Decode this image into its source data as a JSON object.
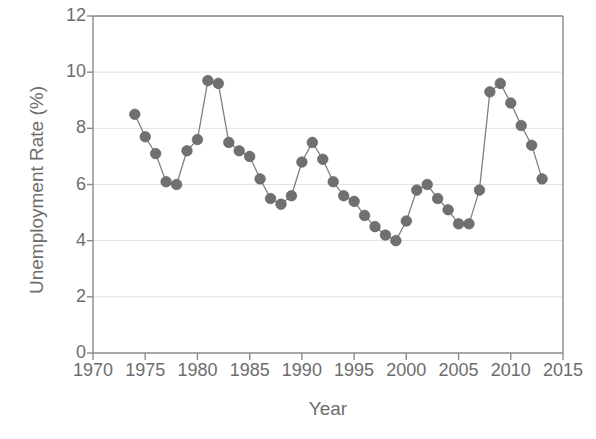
{
  "chart_data": {
    "type": "line",
    "title": "",
    "xlabel": "Year",
    "ylabel": "Unemployment Rate (%)",
    "xlim": [
      1970,
      2015
    ],
    "ylim": [
      0,
      12
    ],
    "xticks": [
      1970,
      1975,
      1980,
      1985,
      1990,
      1995,
      2000,
      2005,
      2010,
      2015
    ],
    "yticks": [
      0,
      2,
      4,
      6,
      8,
      10,
      12
    ],
    "grid": true,
    "legend": null,
    "marker": "circle",
    "marker_color": "#707070",
    "line_color": "#808080",
    "x": [
      1974,
      1975,
      1976,
      1977,
      1978,
      1979,
      1980,
      1981,
      1982,
      1983,
      1984,
      1985,
      1986,
      1987,
      1988,
      1989,
      1990,
      1991,
      1992,
      1993,
      1994,
      1995,
      1996,
      1997,
      1998,
      1999,
      2000,
      2001,
      2002,
      2003,
      2004,
      2005,
      2006,
      2007,
      2008,
      2009,
      2010,
      2011,
      2012,
      2013
    ],
    "values": [
      8.5,
      7.7,
      7.1,
      6.1,
      6.0,
      7.2,
      7.6,
      9.7,
      9.6,
      7.5,
      7.2,
      7.0,
      6.2,
      5.5,
      5.3,
      5.6,
      6.8,
      7.5,
      6.9,
      6.1,
      5.6,
      5.4,
      4.9,
      4.5,
      4.2,
      4.0,
      4.7,
      5.8,
      6.0,
      5.5,
      5.1,
      4.6,
      4.6,
      5.8,
      9.3,
      9.6,
      8.9,
      8.1,
      7.4,
      6.2
    ],
    "point_labels": null
  },
  "axes": {
    "y_tick_labels": [
      "0",
      "2",
      "4",
      "6",
      "8",
      "10",
      "12"
    ],
    "x_tick_labels": [
      "1970",
      "1975",
      "1980",
      "1985",
      "1990",
      "1995",
      "2000",
      "2005",
      "2010",
      "2015"
    ]
  },
  "colors": {
    "text": "#6d6d6d",
    "axis": "#8a8a8a",
    "grid": "#e2e2e2",
    "marker": "#707070",
    "line": "#858585",
    "background": "#ffffff"
  }
}
